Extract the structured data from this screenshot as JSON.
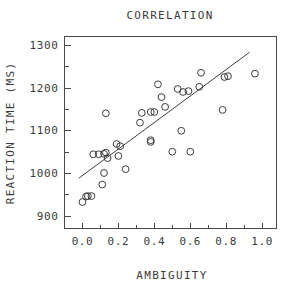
{
  "chart_data": {
    "type": "scatter",
    "title": "CORRELATION",
    "xlabel": "AMBIGUITY",
    "ylabel": "REACTION TIME  (MS)",
    "xlim": [
      -0.1,
      1.08
    ],
    "ylim": [
      870,
      1320
    ],
    "xticks": [
      0.0,
      0.2,
      0.4,
      0.6,
      0.8,
      1.0
    ],
    "xtick_labels": [
      "0.0",
      "0.2",
      "0.4",
      "0.6",
      "0.8",
      "1.0"
    ],
    "yticks": [
      900,
      1000,
      1100,
      1200,
      1300
    ],
    "ytick_labels": [
      "900",
      "1000",
      "1100",
      "1200",
      "1300"
    ],
    "x_minor_ticks": [
      0.1,
      0.3,
      0.5,
      0.7,
      0.9
    ],
    "y_minor_ticks": [
      950,
      1050,
      1150,
      1250
    ],
    "grid": false,
    "legend": null,
    "marker": "open-circle",
    "marker_color": "#3d3d3d",
    "points": [
      {
        "x": 0.0,
        "y": 932
      },
      {
        "x": 0.02,
        "y": 945
      },
      {
        "x": 0.03,
        "y": 946
      },
      {
        "x": 0.05,
        "y": 946
      },
      {
        "x": 0.06,
        "y": 1044
      },
      {
        "x": 0.09,
        "y": 1044
      },
      {
        "x": 0.11,
        "y": 973
      },
      {
        "x": 0.12,
        "y": 1045
      },
      {
        "x": 0.12,
        "y": 1000
      },
      {
        "x": 0.13,
        "y": 1140
      },
      {
        "x": 0.13,
        "y": 1048
      },
      {
        "x": 0.14,
        "y": 1035
      },
      {
        "x": 0.19,
        "y": 1068
      },
      {
        "x": 0.2,
        "y": 1040
      },
      {
        "x": 0.21,
        "y": 1063
      },
      {
        "x": 0.24,
        "y": 1009
      },
      {
        "x": 0.32,
        "y": 1118
      },
      {
        "x": 0.33,
        "y": 1141
      },
      {
        "x": 0.38,
        "y": 1143
      },
      {
        "x": 0.38,
        "y": 1077
      },
      {
        "x": 0.38,
        "y": 1073
      },
      {
        "x": 0.4,
        "y": 1143
      },
      {
        "x": 0.42,
        "y": 1208
      },
      {
        "x": 0.44,
        "y": 1178
      },
      {
        "x": 0.46,
        "y": 1155
      },
      {
        "x": 0.5,
        "y": 1050
      },
      {
        "x": 0.53,
        "y": 1197
      },
      {
        "x": 0.55,
        "y": 1099
      },
      {
        "x": 0.56,
        "y": 1190
      },
      {
        "x": 0.59,
        "y": 1192
      },
      {
        "x": 0.6,
        "y": 1050
      },
      {
        "x": 0.65,
        "y": 1202
      },
      {
        "x": 0.66,
        "y": 1235
      },
      {
        "x": 0.78,
        "y": 1148
      },
      {
        "x": 0.79,
        "y": 1225
      },
      {
        "x": 0.81,
        "y": 1227
      },
      {
        "x": 0.96,
        "y": 1233
      }
    ],
    "fit_line": {
      "x1": -0.02,
      "y1": 988,
      "x2": 0.93,
      "y2": 1283
    }
  }
}
